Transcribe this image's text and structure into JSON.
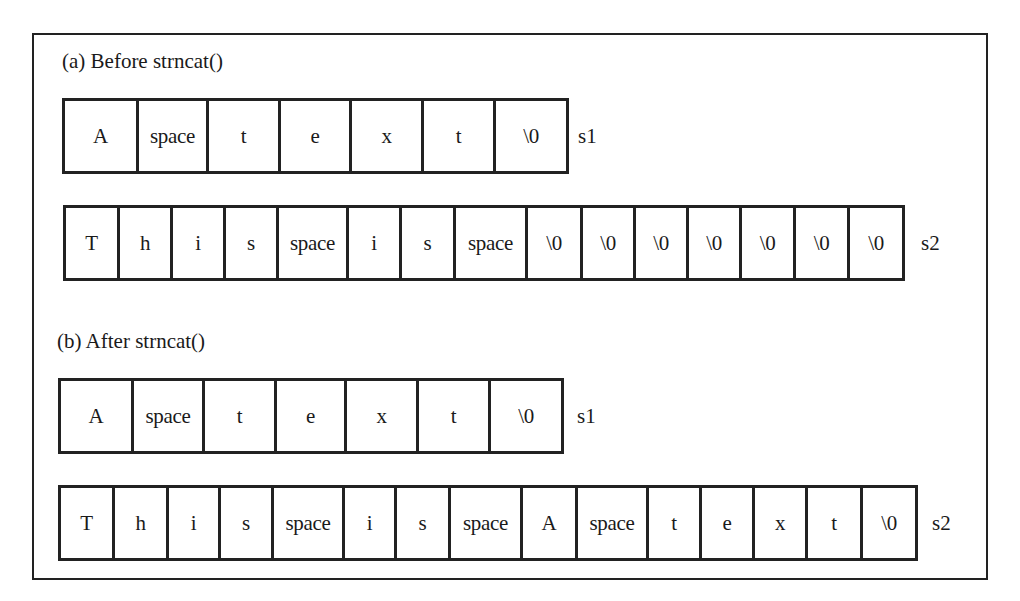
{
  "figure": {
    "sections": [
      {
        "title": "(a) Before strncat()",
        "rows": [
          {
            "var": "s1",
            "cells": [
              "A",
              "space",
              "t",
              "e",
              "x",
              "t",
              "\\0"
            ]
          },
          {
            "var": "s2",
            "cells": [
              "T",
              "h",
              "i",
              "s",
              "space",
              "i",
              "s",
              "space",
              "\\0",
              "\\0",
              "\\0",
              "\\0",
              "\\0",
              "\\0",
              "\\0"
            ]
          }
        ]
      },
      {
        "title": "(b) After strncat()",
        "rows": [
          {
            "var": "s1",
            "cells": [
              "A",
              "space",
              "t",
              "e",
              "x",
              "t",
              "\\0"
            ]
          },
          {
            "var": "s2",
            "cells": [
              "T",
              "h",
              "i",
              "s",
              "space",
              "i",
              "s",
              "space",
              "A",
              "space",
              "t",
              "e",
              "x",
              "t",
              "\\0"
            ]
          }
        ]
      }
    ]
  },
  "colors": {
    "stroke": "#222222",
    "text": "#1a1a1a",
    "background": "#ffffff"
  }
}
